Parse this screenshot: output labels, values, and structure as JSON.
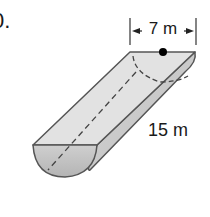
{
  "problem": {
    "number_label": "0."
  },
  "figure": {
    "shape": "half-cylinder",
    "diameter_label": "7 m",
    "length_label": "15 m",
    "colors": {
      "top_face": "#e2e2e2",
      "side_face": "#c8c8c8",
      "end_face": "#bdbdbd",
      "edge": "#555555",
      "dashed": "#444444",
      "center_dot": "#000000",
      "text": "#1a1a1a"
    }
  }
}
